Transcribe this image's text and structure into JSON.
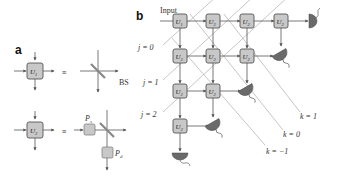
{
  "panel_a": {
    "label": "a",
    "row1": {
      "unit": "U",
      "unit_sub": "1",
      "equiv": "≡",
      "component": "BS"
    },
    "row2": {
      "unit": "U",
      "unit_sub": "2",
      "equiv": "≡",
      "ps_label": "P",
      "ps_sub": "s",
      "pd_label": "P",
      "pd_sub": "d"
    }
  },
  "panel_b": {
    "label": "b",
    "input_label": "Input",
    "j_labels": [
      "j = 0",
      "j = 1",
      "j = 2"
    ],
    "k_labels": [
      "k = 1",
      "k = 0",
      "k = −1"
    ],
    "first_unit": {
      "name": "U",
      "sub": "1"
    },
    "grid_unit": {
      "name": "U",
      "sub": "2"
    }
  },
  "colors": {
    "box_fill": "#c8c8c8",
    "detector": "#6a6a6a",
    "diagonal": "#b8b8b8",
    "wire": "#555555"
  }
}
